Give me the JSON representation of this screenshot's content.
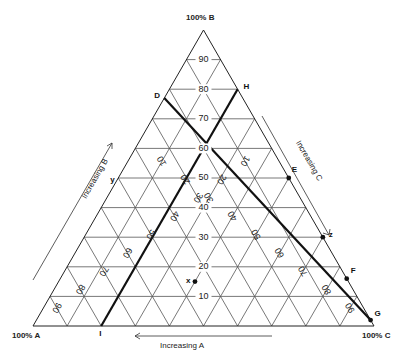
{
  "diagram": {
    "type": "ternary-phase-diagram",
    "corners": {
      "A": "100% A",
      "B": "100% B",
      "C": "100% C"
    },
    "axis_labels": {
      "A": "Increasing A",
      "B": "Increasing B",
      "C": "Increasing C"
    },
    "b_ticks": [
      "10",
      "20",
      "30",
      "40",
      "50",
      "60",
      "70",
      "80",
      "90"
    ],
    "a_ticks": [
      "10",
      "20",
      "30",
      "40",
      "50",
      "60",
      "70",
      "80",
      "90"
    ],
    "c_ticks": [
      "10",
      "20",
      "30",
      "40",
      "50",
      "60",
      "70",
      "80",
      "90"
    ],
    "lines": [
      {
        "name": "D-G",
        "from": "D",
        "to": "G"
      },
      {
        "name": "H-I",
        "from": "H",
        "to": "I"
      }
    ],
    "points": [
      {
        "label": "D",
        "a": 0.23,
        "b": 0.77,
        "c": 0.0,
        "marker": false
      },
      {
        "label": "H",
        "a": 0.0,
        "b": 0.8,
        "c": 0.2,
        "marker": false
      },
      {
        "label": "E",
        "a": 0.0,
        "b": 0.5,
        "c": 0.5,
        "marker": true
      },
      {
        "label": "F",
        "a": 0.0,
        "b": 0.16,
        "c": 0.84,
        "marker": true
      },
      {
        "label": "G",
        "a": 0.0,
        "b": 0.02,
        "c": 0.98,
        "marker": true
      },
      {
        "label": "I",
        "a": 0.8,
        "b": 0.0,
        "c": 0.2,
        "marker": false
      },
      {
        "label": "x",
        "a": 0.45,
        "b": 0.15,
        "c": 0.4,
        "marker": true
      },
      {
        "label": "y",
        "a": 0.5,
        "b": 0.5,
        "c": 0.0,
        "marker": false
      },
      {
        "label": "z",
        "a": 0.0,
        "b": 0.3,
        "c": 0.7,
        "marker": true
      }
    ]
  }
}
